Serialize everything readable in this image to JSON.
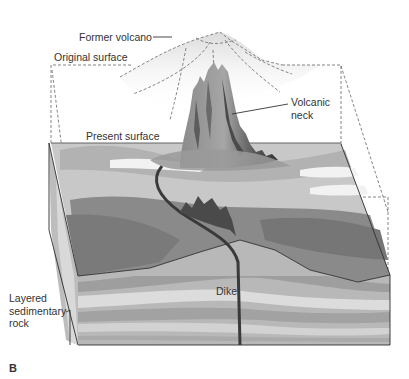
{
  "figure": {
    "panel_letter": "B",
    "labels": {
      "former_volcano": "Former volcano",
      "original_surface": "Original surface",
      "present_surface": "Present surface",
      "volcanic_neck_line1": "Volcanic",
      "volcanic_neck_line2": "neck",
      "dike": "Dike",
      "layered_line1": "Layered",
      "layered_line2": "sedimentary",
      "layered_line3": "rock"
    },
    "colors": {
      "background": "#ffffff",
      "text": "#333333",
      "outline": "#2e2e2e",
      "dashed": "#777777",
      "eroded_mass": "#7d7d7d",
      "eroded_mass_dark": "#6a6a6a",
      "surface_light": "#c4c4c4",
      "surface_mid": "#a8a8a8",
      "layer_light": "#d6d6d6",
      "layer_mid": "#b0b0b0",
      "layer_dark": "#9c9c9c",
      "neck_light": "#9a9a9a",
      "neck_dark": "#3f3f3f",
      "dike": "#3a3a3a",
      "former_volcano_fill": "#e0e0e0"
    }
  }
}
